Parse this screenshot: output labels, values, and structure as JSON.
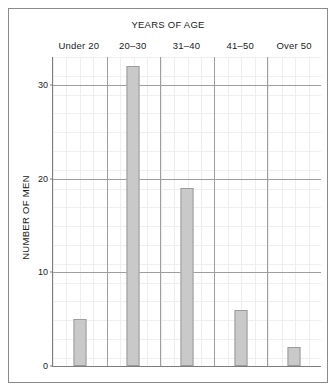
{
  "chart_data": {
    "type": "bar",
    "title": "YEARS OF AGE",
    "xlabel": "YEARS OF AGE",
    "ylabel": "NUMBER OF MEN",
    "categories": [
      "Under 20",
      "20–30",
      "31–40",
      "41–50",
      "Over 50"
    ],
    "values": [
      5,
      32,
      19,
      6,
      2
    ],
    "ylim": [
      0,
      33
    ],
    "yticks": [
      0,
      10,
      20,
      30
    ],
    "ytick_labels": [
      "0",
      "10",
      "20",
      "30"
    ],
    "grid": true,
    "legend": false,
    "bar_color": "#c9c9c9",
    "bar_edge_color": "#9b9b9b",
    "axis_color": "#7d7d7d",
    "grid_color": "#9e9e9e",
    "frame_color": "#8a8a8a"
  }
}
